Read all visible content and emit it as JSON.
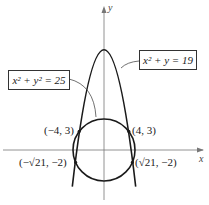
{
  "diagram": {
    "equations": {
      "circle": "x² + y² = 25",
      "parabola": "x² + y = 19"
    },
    "axes": {
      "x_label": "x",
      "y_label": "y"
    },
    "points": [
      {
        "label": "(−4, 3)",
        "x": -4,
        "y": 3
      },
      {
        "label": "(4, 3)",
        "x": 4,
        "y": 3
      },
      {
        "label": "(−√21, −2)",
        "x": -4.583,
        "y": -2
      },
      {
        "label": "(√21, −2)",
        "x": 4.583,
        "y": -2
      }
    ],
    "colors": {
      "curve": "#1a1a1a",
      "axis": "#666666"
    }
  }
}
